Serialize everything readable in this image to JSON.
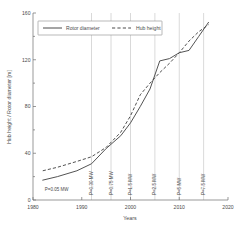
{
  "chart_data": {
    "type": "line",
    "title": "",
    "xlabel": "Years",
    "ylabel": "Hub height / Rotor diameter [m]",
    "xlim": [
      1980,
      2020
    ],
    "ylim": [
      0,
      160
    ],
    "xticks": [
      1980,
      1990,
      2000,
      2010,
      2020
    ],
    "yticks": [
      0,
      40,
      80,
      120,
      160
    ],
    "grid": "vertical-at-annotations",
    "legend_position": "top-left-inside",
    "series": [
      {
        "name": "Rotor diameter",
        "style": "solid",
        "x": [
          1982,
          1985,
          1989,
          1992,
          1995,
          1998,
          2000,
          2002,
          2004,
          2006,
          2008,
          2010,
          2012,
          2014,
          2016
        ],
        "values": [
          17,
          20,
          25,
          31,
          44,
          55,
          66,
          80,
          95,
          119,
          121,
          126,
          128,
          140,
          152
        ]
      },
      {
        "name": "Hub height",
        "style": "dashed",
        "x": [
          1982,
          1985,
          1989,
          1992,
          1995,
          1998,
          2000,
          2002,
          2004,
          2006,
          2008,
          2010,
          2012,
          2014,
          2016
        ],
        "values": [
          25,
          28,
          33,
          37,
          45,
          58,
          72,
          90,
          100,
          109,
          117,
          126,
          136,
          144,
          150
        ]
      }
    ],
    "annotations": [
      {
        "label": "P=0.05 MW",
        "x": 1982,
        "orientation": "horizontal"
      },
      {
        "label": "P=0.30 MW",
        "x": 1992,
        "orientation": "vertical"
      },
      {
        "label": "P=0.75 MW",
        "x": 1996,
        "orientation": "vertical"
      },
      {
        "label": "P=1.5 MW",
        "x": 2000,
        "orientation": "vertical"
      },
      {
        "label": "P=2.5 MW",
        "x": 2005,
        "orientation": "vertical"
      },
      {
        "label": "P=5 MW",
        "x": 2010,
        "orientation": "vertical"
      },
      {
        "label": "P=7.5 MW",
        "x": 2015,
        "orientation": "vertical"
      }
    ]
  },
  "legend": {
    "entries": [
      {
        "label": "Rotor diameter"
      },
      {
        "label": "Hub height"
      }
    ]
  },
  "axes": {
    "x_title": "Years",
    "y_title": "Hub height / Rotor diameter [m]",
    "x_tick_labels": [
      "1980",
      "1990",
      "2000",
      "2010",
      "2020"
    ],
    "y_tick_labels": [
      "0",
      "40",
      "80",
      "120",
      "160"
    ]
  },
  "annotation_labels": {
    "a0": "P=0.05 MW",
    "a1": "P=0.30 MW",
    "a2": "P=0.75 MW",
    "a3": "P=1.5 MW",
    "a4": "P=2.5 MW",
    "a5": "P=5 MW",
    "a6": "P=7.5 MW"
  },
  "colors": {
    "line": "#4a4a4a",
    "axis": "#6e6e6e",
    "grid": "#b9b9b9",
    "background": "#ffffff"
  }
}
